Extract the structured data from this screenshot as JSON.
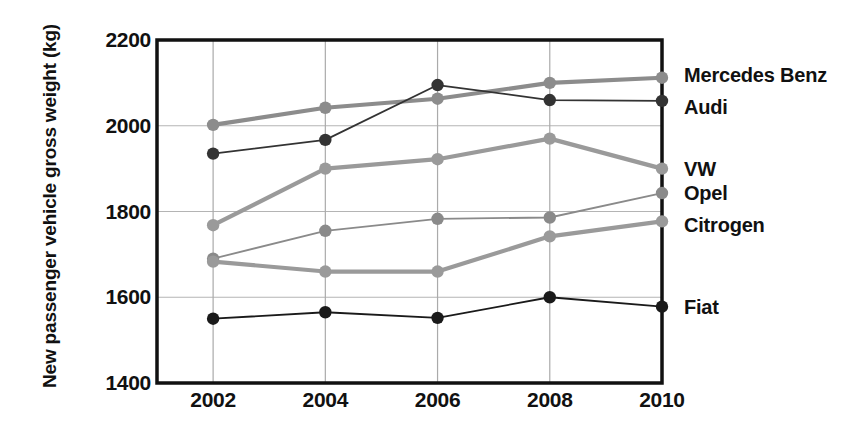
{
  "chart_data": {
    "type": "line",
    "title": "",
    "xlabel": "",
    "ylabel": "New passenger vehicle gross weight (kg)",
    "x": [
      2002,
      2004,
      2006,
      2008,
      2010
    ],
    "categories": [
      "2002",
      "2004",
      "2006",
      "2008",
      "2010"
    ],
    "ylim": [
      1400,
      2200
    ],
    "yticks": [
      1400,
      1600,
      1800,
      2000,
      2200
    ],
    "ytick_labels": [
      "1400",
      "1600",
      "1800",
      "2000",
      "2200"
    ],
    "xlim": [
      2001,
      2010
    ],
    "grid": true,
    "legend_position": "right-of-axes-end-labels",
    "series": [
      {
        "name": "Mercedes Benz",
        "color": "#8c8c8c",
        "marker": "circle",
        "linewidth": "thick",
        "values": [
          2002,
          2042,
          2063,
          2100,
          2112
        ]
      },
      {
        "name": "Audi",
        "color": "#333333",
        "marker": "circle",
        "linewidth": "thin",
        "values": [
          1935,
          1967,
          2095,
          2060,
          2058
        ]
      },
      {
        "name": "VW",
        "color": "#9a9a9a",
        "marker": "circle",
        "linewidth": "thick",
        "values": [
          1768,
          1900,
          1922,
          1970,
          1900
        ]
      },
      {
        "name": "Opel",
        "color": "#8a8a8a",
        "marker": "circle",
        "linewidth": "thin",
        "values": [
          1690,
          1755,
          1783,
          1786,
          1843
        ]
      },
      {
        "name": "Citrogen",
        "color": "#9a9a9a",
        "marker": "circle",
        "linewidth": "thick",
        "values": [
          1683,
          1660,
          1660,
          1742,
          1777
        ]
      },
      {
        "name": "Fiat",
        "color": "#1a1a1a",
        "marker": "circle",
        "linewidth": "thin",
        "values": [
          1550,
          1565,
          1552,
          1600,
          1578
        ]
      }
    ]
  }
}
